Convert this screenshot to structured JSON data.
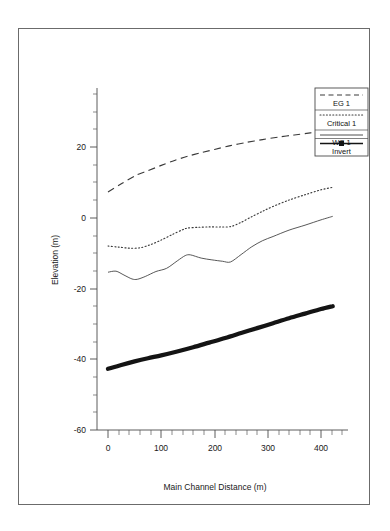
{
  "chart_data": {
    "type": "line",
    "title": "",
    "xlabel": "Main Channel Distance (m)",
    "ylabel": "Elevation (m)",
    "xlim": [
      -20,
      430
    ],
    "ylim": [
      -62,
      32
    ],
    "xticks": [
      0,
      100,
      200,
      300,
      400
    ],
    "xticklabels": [
      "0",
      "100",
      "200",
      "300",
      "400"
    ],
    "yticks": [
      20,
      0,
      -20,
      -40,
      -60
    ],
    "yticklabels": [
      "20",
      "0",
      "-20",
      "-40",
      "-60"
    ],
    "x_minor_interval": 20,
    "y_minor_interval": 5,
    "grid": false,
    "legend_position": "top-right",
    "series": [
      {
        "name": "EG 1",
        "style": "dashed",
        "x": [
          0,
          25,
          50,
          55,
          75,
          100,
          125,
          150,
          175,
          200,
          230,
          260,
          290,
          320,
          350,
          380,
          410,
          422
        ],
        "values": [
          7.3,
          9.6,
          11.8,
          12.2,
          13.3,
          14.8,
          16.2,
          17.4,
          18.4,
          19.3,
          20.4,
          21.3,
          22.1,
          22.8,
          23.4,
          24.0,
          24.6,
          24.9
        ]
      },
      {
        "name": "Critical 1",
        "style": "dotted",
        "x": [
          0,
          20,
          40,
          60,
          80,
          100,
          120,
          140,
          150,
          170,
          190,
          210,
          230,
          250,
          270,
          290,
          310,
          340,
          370,
          400,
          422
        ],
        "values": [
          -8.0,
          -8.3,
          -8.6,
          -8.5,
          -7.6,
          -6.3,
          -4.8,
          -3.4,
          -2.9,
          -2.7,
          -2.6,
          -2.6,
          -2.5,
          -1.3,
          0.3,
          1.8,
          3.2,
          5.0,
          6.5,
          7.9,
          8.6
        ]
      },
      {
        "name": "WS 1",
        "style": "solid-thin",
        "x": [
          0,
          15,
          30,
          45,
          55,
          70,
          90,
          110,
          130,
          145,
          155,
          175,
          195,
          215,
          230,
          250,
          270,
          290,
          310,
          340,
          370,
          400,
          422
        ],
        "values": [
          -15.4,
          -15.1,
          -16.2,
          -17.3,
          -17.4,
          -16.6,
          -15.2,
          -14.3,
          -12.2,
          -10.7,
          -10.5,
          -11.4,
          -11.9,
          -12.3,
          -12.5,
          -10.4,
          -8.2,
          -6.5,
          -5.3,
          -3.5,
          -2.1,
          -0.6,
          0.4
        ]
      },
      {
        "name": "Invert",
        "style": "solid-thick",
        "x": [
          0,
          25,
          50,
          75,
          100,
          130,
          160,
          190,
          220,
          250,
          280,
          310,
          340,
          370,
          400,
          422
        ],
        "values": [
          -42.7,
          -41.6,
          -40.6,
          -39.7,
          -38.9,
          -37.8,
          -36.6,
          -35.3,
          -34.0,
          -32.6,
          -31.2,
          -29.8,
          -28.4,
          -27.1,
          -25.8,
          -25.0
        ]
      }
    ]
  },
  "legend": {
    "entries": [
      {
        "label": "EG 1",
        "style": "dashed"
      },
      {
        "label": "Critical 1",
        "style": "dotted"
      },
      {
        "label": "WS 1",
        "style": "solid-thin"
      },
      {
        "label": "Invert",
        "style": "solid-thick-marker"
      }
    ]
  }
}
